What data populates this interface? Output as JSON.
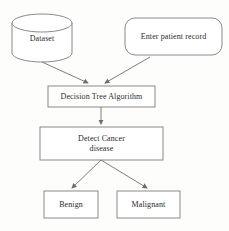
{
  "diagram": {
    "stroke_color": "#7d7d7d",
    "text_color": "#2b2b2b",
    "background_color": "#fdfdfb",
    "nodes": {
      "dataset": {
        "label": "Dataset",
        "shape": "cylinder"
      },
      "enter_patient_record": {
        "label": "Enter patient record",
        "shape": "rounded-rectangle"
      },
      "decision_tree_algorithm": {
        "label": "Decision Tree Algorithm",
        "shape": "rectangle"
      },
      "detect_cancer": {
        "label": "Detect Cancer\ndisease",
        "shape": "rectangle"
      },
      "benign": {
        "label": "Benign",
        "shape": "rectangle"
      },
      "malignant": {
        "label": "Malignant",
        "shape": "rectangle"
      }
    }
  }
}
